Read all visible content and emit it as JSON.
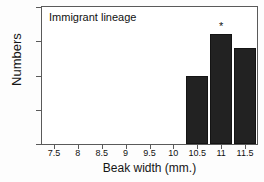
{
  "chart_data": {
    "type": "bar",
    "title": "Immigrant lineage",
    "xlabel": "Beak width (mm.)",
    "ylabel": "Numbers",
    "categories": [
      "7.5",
      "8",
      "8.5",
      "9",
      "9.5",
      "10",
      "10.5",
      "11",
      "11.5"
    ],
    "x": [
      7.5,
      8,
      8.5,
      9,
      9.5,
      10,
      10.5,
      11,
      11.5
    ],
    "values": [
      0,
      0,
      0,
      0,
      0,
      0,
      5,
      8,
      7
    ],
    "bars": [
      {
        "x": 10.5,
        "value": 5,
        "label": "",
        "annotation": ""
      },
      {
        "x": 11,
        "value": 8,
        "label": "",
        "annotation": "*"
      },
      {
        "x": 11.5,
        "value": 7,
        "label": "",
        "annotation": ""
      }
    ],
    "annotations": [
      {
        "x": 11,
        "y": 8,
        "text": "*",
        "meaning": "significance-marker"
      }
    ],
    "xlim": [
      7.25,
      11.75
    ],
    "ylim": [
      0,
      10
    ],
    "yticks": [
      0,
      2.5,
      5,
      7.5,
      10
    ],
    "ytick_labels": [
      "0",
      "2.5",
      "5",
      "7.5",
      "10"
    ],
    "xticks": [
      7.5,
      8,
      8.5,
      9,
      9.5,
      10,
      10.5,
      11,
      11.5
    ],
    "xtick_labels": [
      "7.5",
      "8",
      "8.5",
      "9",
      "9.5",
      "10",
      "10.5",
      "11",
      "11.5"
    ],
    "grid": false,
    "legend": false,
    "bar_color": "#222222",
    "axis_color": "#5a5a5a",
    "background": "#ffffff"
  }
}
